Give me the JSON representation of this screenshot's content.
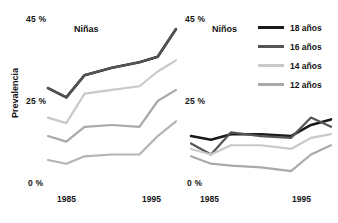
{
  "chart_data": {
    "type": "line",
    "title": "",
    "ylabel": "Prevalencia",
    "xlabel": "",
    "ylim": [
      0,
      45
    ],
    "xlim": [
      1983,
      1997
    ],
    "grid": false,
    "legend_position": "right",
    "ytick_labels": [
      "45 %",
      "25 %",
      "0 %"
    ],
    "ytick_values": [
      45,
      25,
      0
    ],
    "xtick_labels": [
      "1985",
      "1995"
    ],
    "xtick_values": [
      1985,
      1995
    ],
    "panels": [
      {
        "name": "Niñas",
        "x": [
          1983,
          1985,
          1987,
          1990,
          1993,
          1995,
          1997
        ],
        "series": [
          {
            "name": "18 años",
            "color": "#1a1a1a",
            "width": 2.6,
            "values": [
              26.0,
              23.5,
              29.5,
              31.5,
              33.0,
              34.5,
              42.0
            ]
          },
          {
            "name": "16 años",
            "color": "#555555",
            "width": 2.2,
            "values": [
              26.0,
              23.5,
              29.5,
              31.5,
              33.0,
              34.5,
              42.0
            ]
          },
          {
            "name": "14 años",
            "color": "#c9c9c9",
            "width": 2.2,
            "values": [
              18.0,
              16.5,
              24.5,
              25.5,
              26.5,
              30.5,
              33.5
            ]
          },
          {
            "name": "12 años",
            "color": "#a9a9a9",
            "width": 2.2,
            "values": [
              13.0,
              11.5,
              15.5,
              16.0,
              15.5,
              22.5,
              25.5
            ]
          }
        ],
        "extra_series": [
          {
            "name": "lowest",
            "color": "#b4b4b4",
            "width": 2.2,
            "values": [
              6.5,
              5.5,
              7.5,
              8.0,
              8.0,
              13.0,
              17.0
            ]
          }
        ]
      },
      {
        "name": "Niños",
        "x": [
          1983,
          1985,
          1987,
          1990,
          1993,
          1995,
          1997
        ],
        "series": [
          {
            "name": "18 años",
            "color": "#1a1a1a",
            "width": 2.6,
            "values": [
              13.0,
              12.0,
              13.5,
              13.5,
              13.0,
              16.0,
              17.5
            ]
          },
          {
            "name": "16 años",
            "color": "#555555",
            "width": 2.2,
            "values": [
              11.0,
              8.0,
              14.0,
              13.0,
              12.5,
              18.0,
              15.5
            ]
          },
          {
            "name": "14 años",
            "color": "#c9c9c9",
            "width": 2.2,
            "values": [
              9.5,
              8.0,
              10.5,
              10.5,
              9.5,
              12.5,
              13.5
            ]
          },
          {
            "name": "12 años",
            "color": "#a9a9a9",
            "width": 2.2,
            "values": [
              7.5,
              5.5,
              5.0,
              4.5,
              3.5,
              8.0,
              10.5
            ]
          }
        ],
        "extra_series": []
      }
    ]
  },
  "left_panel": {
    "title": "Niñas",
    "ylabel": "Prevalencia",
    "y_top": "45 %",
    "y_mid": "25 %",
    "y_bottom": "0 %",
    "x_first": "1985",
    "x_second": "1995"
  },
  "right_panel": {
    "title": "Niños",
    "y_top": "45 %",
    "y_mid": "25 %",
    "y_bottom": "0 %",
    "x_first": "1985",
    "x_second": "1995"
  },
  "legend": {
    "items": [
      {
        "label": "18 años",
        "color": "#1a1a1a",
        "thickness": "3.2px"
      },
      {
        "label": "16 años",
        "color": "#555555",
        "thickness": "3px"
      },
      {
        "label": "14 años",
        "color": "#c9c9c9",
        "thickness": "2.6px"
      },
      {
        "label": "12 años",
        "color": "#a9a9a9",
        "thickness": "2.6px"
      }
    ]
  }
}
